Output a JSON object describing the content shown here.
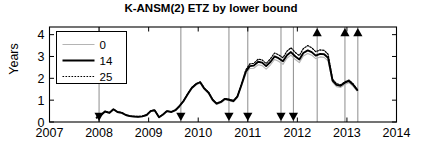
{
  "chart_data": {
    "type": "line",
    "title": "K-ANSM(2) ETZ by lower bound",
    "xlabel": "",
    "ylabel": "Years",
    "xlim": [
      2007,
      2014
    ],
    "ylim": [
      0,
      4.35
    ],
    "xticks": [
      "2007",
      "2008",
      "2009",
      "2010",
      "2011",
      "2012",
      "2013",
      "2014"
    ],
    "xtick_values": [
      2007,
      2008,
      2009,
      2010,
      2011,
      2012,
      2013,
      2014
    ],
    "yticks": [
      "0",
      "1",
      "2",
      "3",
      "4"
    ],
    "ytick_values": [
      0,
      1,
      2,
      3,
      4
    ],
    "grid": false,
    "legend_position": "upper left",
    "legend_entries": [
      {
        "label": "0",
        "style": "solid-light-gray",
        "color": "#b4b4b4",
        "width": 1.1
      },
      {
        "label": "14",
        "style": "solid-black",
        "color": "#000000",
        "width": 1.9
      },
      {
        "label": "25",
        "style": "dotted-black",
        "color": "#000000",
        "width": 1.2
      }
    ],
    "x": [
      2007.95,
      2008.04,
      2008.12,
      2008.21,
      2008.29,
      2008.37,
      2008.46,
      2008.54,
      2008.62,
      2008.71,
      2008.79,
      2008.87,
      2008.96,
      2009.04,
      2009.12,
      2009.21,
      2009.29,
      2009.37,
      2009.46,
      2009.54,
      2009.62,
      2009.71,
      2009.79,
      2009.87,
      2009.96,
      2010.04,
      2010.12,
      2010.21,
      2010.29,
      2010.37,
      2010.46,
      2010.54,
      2010.62,
      2010.71,
      2010.79,
      2010.87,
      2010.96,
      2011.04,
      2011.12,
      2011.21,
      2011.29,
      2011.37,
      2011.46,
      2011.54,
      2011.62,
      2011.71,
      2011.79,
      2011.87,
      2011.96,
      2012.04,
      2012.12,
      2012.21,
      2012.29,
      2012.37,
      2012.46,
      2012.54,
      2012.62,
      2012.71,
      2012.79,
      2012.87,
      2012.96,
      2013.04,
      2013.12,
      2013.21
    ],
    "series": [
      {
        "name": "0",
        "values": [
          0.18,
          0.3,
          0.46,
          0.4,
          0.56,
          0.44,
          0.4,
          0.3,
          0.25,
          0.23,
          0.22,
          0.24,
          0.3,
          0.48,
          0.52,
          0.2,
          0.32,
          0.48,
          0.44,
          0.52,
          0.7,
          0.95,
          1.25,
          1.52,
          1.7,
          1.78,
          1.5,
          1.3,
          0.98,
          0.8,
          0.88,
          1.02,
          0.98,
          0.92,
          1.12,
          1.62,
          2.2,
          2.45,
          2.46,
          2.62,
          2.58,
          2.42,
          2.62,
          2.86,
          2.78,
          2.64,
          2.92,
          3.06,
          2.86,
          2.72,
          3.02,
          3.14,
          3.06,
          2.9,
          2.98,
          2.96,
          2.8,
          1.82,
          1.62,
          1.58,
          1.72,
          1.8,
          1.64,
          1.4
        ],
        "color": "#b4b4b4",
        "width": 1.1,
        "dash": "none"
      },
      {
        "name": "14",
        "values": [
          0.2,
          0.32,
          0.48,
          0.42,
          0.58,
          0.46,
          0.42,
          0.32,
          0.27,
          0.25,
          0.24,
          0.26,
          0.32,
          0.5,
          0.54,
          0.22,
          0.34,
          0.5,
          0.46,
          0.54,
          0.72,
          0.98,
          1.28,
          1.56,
          1.74,
          1.82,
          1.54,
          1.34,
          1.02,
          0.84,
          0.92,
          1.06,
          1.02,
          0.96,
          1.16,
          1.68,
          2.3,
          2.56,
          2.58,
          2.76,
          2.72,
          2.56,
          2.76,
          3.0,
          2.92,
          2.78,
          3.06,
          3.2,
          3.0,
          2.86,
          3.16,
          3.28,
          3.2,
          3.04,
          3.12,
          3.1,
          2.94,
          1.9,
          1.7,
          1.66,
          1.8,
          1.88,
          1.72,
          1.46
        ],
        "color": "#000000",
        "width": 1.9,
        "dash": "none"
      },
      {
        "name": "25",
        "values": [
          0.21,
          0.33,
          0.49,
          0.43,
          0.59,
          0.47,
          0.43,
          0.33,
          0.28,
          0.26,
          0.25,
          0.27,
          0.33,
          0.51,
          0.55,
          0.23,
          0.35,
          0.51,
          0.47,
          0.55,
          0.73,
          0.99,
          1.3,
          1.58,
          1.76,
          1.84,
          1.56,
          1.36,
          1.04,
          0.86,
          0.94,
          1.08,
          1.04,
          0.98,
          1.18,
          1.72,
          2.38,
          2.66,
          2.68,
          2.88,
          2.84,
          2.68,
          2.9,
          3.16,
          3.08,
          2.94,
          3.24,
          3.4,
          3.18,
          3.04,
          3.36,
          3.5,
          3.4,
          3.22,
          3.3,
          3.28,
          3.1,
          1.96,
          1.76,
          1.7,
          1.84,
          1.92,
          1.76,
          1.48
        ],
        "color": "#000000",
        "width": 1.2,
        "dash": "1.6,1.4"
      }
    ],
    "event_markers": {
      "down_triangle_label": "down-event",
      "up_triangle_label": "up-event",
      "down_events": [
        2008.0,
        2009.65,
        2010.62,
        2011.0,
        2011.67,
        2011.92
      ],
      "up_events": [
        2012.4,
        2012.96,
        2013.22
      ],
      "vline_color": "#808080"
    }
  }
}
